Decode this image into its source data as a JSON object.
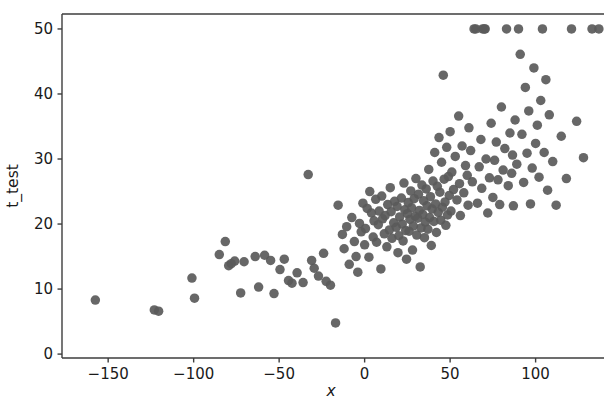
{
  "chart_data": {
    "type": "scatter",
    "title": "",
    "xlabel": "x",
    "ylabel": "t_test",
    "xlim": [
      -177,
      140
    ],
    "ylim": [
      -0.6,
      52.3
    ],
    "xticks": [
      -150,
      -100,
      -50,
      0,
      50,
      100
    ],
    "xtick_labels": [
      "−150",
      "−100",
      "−50",
      "0",
      "50",
      "100"
    ],
    "yticks": [
      0,
      10,
      20,
      30,
      40,
      50
    ],
    "ytick_labels": [
      "0",
      "10",
      "20",
      "30",
      "40",
      "50"
    ],
    "grid": false,
    "legend": null,
    "marker": {
      "shape": "circle",
      "color": "#5a5a5a",
      "size": 9.5,
      "alpha": 0.92,
      "edge_color": "none"
    },
    "spines": {
      "top": true,
      "bottom": true,
      "left": true,
      "right": false,
      "color": "#3d3d3d"
    },
    "n_points": 205,
    "points": [
      [
        -157.5,
        8.3
      ],
      [
        -123.0,
        6.8
      ],
      [
        -120.5,
        6.6
      ],
      [
        -101.0,
        11.7
      ],
      [
        -99.5,
        8.6
      ],
      [
        -85.0,
        15.3
      ],
      [
        -81.5,
        17.3
      ],
      [
        -79.5,
        13.6
      ],
      [
        -78.0,
        13.9
      ],
      [
        -76.0,
        14.3
      ],
      [
        -72.5,
        9.4
      ],
      [
        -70.5,
        14.2
      ],
      [
        -64.0,
        15.0
      ],
      [
        -62.0,
        10.3
      ],
      [
        -58.5,
        15.2
      ],
      [
        -55.0,
        14.4
      ],
      [
        -53.0,
        9.3
      ],
      [
        -49.5,
        13.0
      ],
      [
        -47.0,
        14.6
      ],
      [
        -44.5,
        11.3
      ],
      [
        -42.5,
        10.9
      ],
      [
        -39.5,
        12.5
      ],
      [
        -36.0,
        11.0
      ],
      [
        -33.0,
        27.6
      ],
      [
        -31.0,
        14.4
      ],
      [
        -29.5,
        13.2
      ],
      [
        -27.0,
        12.0
      ],
      [
        -24.0,
        15.5
      ],
      [
        -22.5,
        11.2
      ],
      [
        -20.0,
        10.6
      ],
      [
        -17.0,
        4.8
      ],
      [
        -15.5,
        22.9
      ],
      [
        -13.0,
        18.4
      ],
      [
        -12.0,
        16.2
      ],
      [
        -10.5,
        19.6
      ],
      [
        -9.0,
        13.8
      ],
      [
        -7.5,
        21.0
      ],
      [
        -6.0,
        17.3
      ],
      [
        -5.0,
        15.0
      ],
      [
        -4.0,
        12.6
      ],
      [
        -3.0,
        20.1
      ],
      [
        -2.0,
        18.8
      ],
      [
        -1.0,
        23.2
      ],
      [
        0.0,
        16.8
      ],
      [
        0.5,
        19.3
      ],
      [
        1.5,
        22.4
      ],
      [
        2.5,
        14.9
      ],
      [
        3.0,
        25.0
      ],
      [
        4.0,
        21.7
      ],
      [
        5.0,
        18.0
      ],
      [
        5.5,
        20.5
      ],
      [
        6.5,
        23.8
      ],
      [
        7.0,
        17.2
      ],
      [
        8.0,
        19.9
      ],
      [
        8.5,
        22.0
      ],
      [
        9.5,
        13.1
      ],
      [
        10.0,
        24.3
      ],
      [
        10.5,
        20.8
      ],
      [
        11.5,
        18.5
      ],
      [
        12.0,
        21.3
      ],
      [
        13.0,
        16.5
      ],
      [
        13.5,
        23.0
      ],
      [
        14.5,
        19.1
      ],
      [
        15.0,
        25.6
      ],
      [
        15.5,
        21.9
      ],
      [
        16.0,
        17.8
      ],
      [
        17.0,
        20.2
      ],
      [
        17.5,
        23.5
      ],
      [
        18.5,
        19.5
      ],
      [
        19.0,
        22.7
      ],
      [
        19.5,
        15.6
      ],
      [
        20.0,
        18.2
      ],
      [
        20.5,
        21.1
      ],
      [
        21.5,
        24.0
      ],
      [
        22.0,
        20.0
      ],
      [
        22.5,
        17.4
      ],
      [
        23.0,
        26.3
      ],
      [
        23.5,
        22.2
      ],
      [
        24.0,
        19.0
      ],
      [
        24.5,
        14.6
      ],
      [
        25.0,
        21.6
      ],
      [
        25.5,
        23.3
      ],
      [
        26.0,
        18.9
      ],
      [
        26.5,
        20.7
      ],
      [
        27.0,
        25.1
      ],
      [
        27.5,
        22.5
      ],
      [
        28.0,
        16.0
      ],
      [
        28.5,
        19.7
      ],
      [
        29.0,
        23.9
      ],
      [
        29.5,
        21.2
      ],
      [
        30.0,
        27.0
      ],
      [
        30.5,
        18.3
      ],
      [
        31.0,
        20.9
      ],
      [
        31.5,
        24.6
      ],
      [
        32.0,
        22.1
      ],
      [
        32.5,
        13.4
      ],
      [
        33.0,
        19.4
      ],
      [
        33.5,
        26.0
      ],
      [
        34.0,
        21.5
      ],
      [
        34.5,
        23.6
      ],
      [
        35.0,
        17.9
      ],
      [
        35.5,
        20.3
      ],
      [
        36.0,
        25.4
      ],
      [
        36.5,
        22.8
      ],
      [
        37.0,
        19.2
      ],
      [
        37.5,
        28.4
      ],
      [
        38.0,
        21.0
      ],
      [
        38.5,
        24.2
      ],
      [
        39.0,
        16.7
      ],
      [
        39.5,
        22.3
      ],
      [
        40.0,
        26.6
      ],
      [
        40.5,
        20.4
      ],
      [
        41.0,
        31.0
      ],
      [
        41.5,
        23.1
      ],
      [
        42.0,
        18.7
      ],
      [
        42.5,
        25.8
      ],
      [
        43.0,
        21.8
      ],
      [
        43.5,
        33.3
      ],
      [
        44.0,
        24.9
      ],
      [
        44.5,
        20.6
      ],
      [
        45.0,
        29.5
      ],
      [
        45.5,
        22.6
      ],
      [
        46.0,
        42.9
      ],
      [
        46.5,
        26.9
      ],
      [
        47.0,
        23.4
      ],
      [
        47.5,
        19.8
      ],
      [
        48.0,
        31.8
      ],
      [
        48.5,
        21.4
      ],
      [
        49.0,
        27.3
      ],
      [
        49.5,
        24.4
      ],
      [
        50.0,
        34.2
      ],
      [
        50.5,
        22.0
      ],
      [
        51.0,
        28.0
      ],
      [
        52.0,
        25.3
      ],
      [
        53.0,
        30.4
      ],
      [
        54.0,
        23.7
      ],
      [
        55.0,
        36.6
      ],
      [
        55.5,
        26.2
      ],
      [
        56.0,
        21.3
      ],
      [
        57.0,
        32.0
      ],
      [
        58.0,
        24.8
      ],
      [
        59.0,
        29.0
      ],
      [
        60.0,
        27.5
      ],
      [
        60.5,
        22.9
      ],
      [
        61.0,
        34.8
      ],
      [
        62.0,
        31.3
      ],
      [
        63.0,
        26.5
      ],
      [
        64.0,
        50.0
      ],
      [
        65.0,
        50.0
      ],
      [
        66.0,
        23.2
      ],
      [
        67.0,
        28.8
      ],
      [
        68.0,
        33.0
      ],
      [
        68.5,
        25.5
      ],
      [
        69.0,
        50.0
      ],
      [
        70.0,
        50.0
      ],
      [
        70.5,
        50.0
      ],
      [
        71.0,
        30.0
      ],
      [
        72.0,
        21.7
      ],
      [
        73.0,
        27.1
      ],
      [
        74.0,
        35.5
      ],
      [
        75.0,
        24.1
      ],
      [
        76.0,
        29.8
      ],
      [
        77.0,
        32.6
      ],
      [
        78.0,
        26.8
      ],
      [
        79.0,
        23.0
      ],
      [
        80.0,
        38.0
      ],
      [
        81.0,
        28.3
      ],
      [
        82.0,
        31.6
      ],
      [
        83.0,
        50.0
      ],
      [
        84.0,
        25.9
      ],
      [
        85.0,
        34.0
      ],
      [
        86.0,
        27.8
      ],
      [
        86.5,
        30.6
      ],
      [
        87.0,
        22.8
      ],
      [
        88.0,
        36.0
      ],
      [
        89.0,
        29.2
      ],
      [
        90.0,
        50.0
      ],
      [
        91.0,
        46.1
      ],
      [
        92.0,
        33.8
      ],
      [
        93.0,
        26.4
      ],
      [
        94.0,
        41.0
      ],
      [
        95.0,
        30.9
      ],
      [
        96.0,
        37.4
      ],
      [
        97.0,
        23.1
      ],
      [
        98.0,
        28.6
      ],
      [
        99.0,
        44.0
      ],
      [
        100.0,
        32.4
      ],
      [
        101.0,
        35.2
      ],
      [
        102.0,
        27.2
      ],
      [
        103.0,
        39.0
      ],
      [
        104.0,
        50.0
      ],
      [
        105.0,
        31.0
      ],
      [
        106.0,
        42.2
      ],
      [
        107.0,
        25.2
      ],
      [
        108.0,
        36.8
      ],
      [
        110.0,
        29.6
      ],
      [
        112.0,
        22.9
      ],
      [
        115.0,
        33.5
      ],
      [
        118.0,
        27.0
      ],
      [
        121.0,
        50.0
      ],
      [
        124.0,
        35.8
      ],
      [
        128.0,
        30.2
      ],
      [
        133.0,
        50.0
      ],
      [
        137.0,
        50.0
      ]
    ]
  },
  "axes": {
    "xlabel": "x",
    "ylabel": "t_test"
  }
}
